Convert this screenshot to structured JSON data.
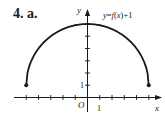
{
  "problem_label": "4. a.",
  "chart_data": {
    "type": "line",
    "title": "",
    "curve_label": "y = f(x) + 1",
    "function": "y = sqrt(25 - x^2) + 1",
    "xlabel": "x",
    "ylabel": "y",
    "origin_label": "O",
    "x_tick_label": "1",
    "y_tick_label": "1",
    "xlim": [
      -6,
      6
    ],
    "ylim": [
      0,
      7
    ],
    "x_ticks": [
      -5,
      -4,
      -3,
      -2,
      -1,
      1,
      2,
      3,
      4,
      5
    ],
    "y_ticks": [
      1,
      2,
      3,
      4,
      5
    ],
    "grid": false,
    "legend": "none",
    "endpoints": [
      {
        "x": -5,
        "y": 1,
        "filled": true
      },
      {
        "x": 5,
        "y": 1,
        "filled": true
      }
    ],
    "x": [
      -5,
      -4,
      -3,
      -2,
      -1,
      0,
      1,
      2,
      3,
      4,
      5
    ],
    "values": [
      1,
      4,
      5,
      5.58,
      5.9,
      6,
      5.9,
      5.58,
      5,
      4,
      1
    ]
  }
}
